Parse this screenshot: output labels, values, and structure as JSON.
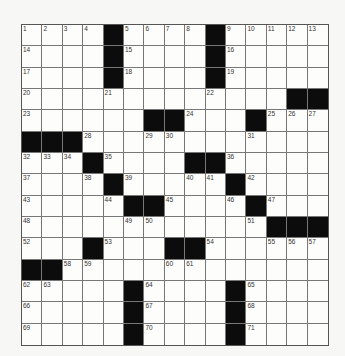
{
  "puzzle": {
    "rows": 15,
    "cols": 15,
    "grid": [
      [
        "1",
        "2",
        "3",
        "4",
        "#",
        "5",
        "6",
        "7",
        "8",
        "#",
        "9",
        "10",
        "11",
        "12",
        "13"
      ],
      [
        "14",
        "",
        "",
        "",
        "#",
        "15",
        "",
        "",
        "",
        "#",
        "16",
        "",
        "",
        "",
        ""
      ],
      [
        "17",
        "",
        "",
        "",
        "#",
        "18",
        "",
        "",
        "",
        "#",
        "19",
        "",
        "",
        "",
        ""
      ],
      [
        "20",
        "",
        "",
        "",
        "21",
        "",
        "",
        "",
        "",
        "22",
        "",
        "",
        "",
        "#",
        "#"
      ],
      [
        "23",
        "",
        "",
        "",
        "",
        "",
        "#",
        "#",
        "24",
        "",
        "",
        "#",
        "25",
        "26",
        "27"
      ],
      [
        "#",
        "#",
        "#",
        "28",
        "",
        "",
        "29",
        "30",
        "",
        "",
        "",
        "31",
        "",
        "",
        ""
      ],
      [
        "32",
        "33",
        "34",
        "#",
        "35",
        "",
        "",
        "",
        "#",
        "#",
        "36",
        "",
        "",
        "",
        ""
      ],
      [
        "37",
        "",
        "",
        "38",
        "#",
        "39",
        "",
        "",
        "40",
        "41",
        "#",
        "42",
        "",
        "",
        ""
      ],
      [
        "43",
        "",
        "",
        "",
        "44",
        "#",
        "#",
        "45",
        "",
        "",
        "46",
        "#",
        "47",
        "",
        ""
      ],
      [
        "48",
        "",
        "",
        "",
        "",
        "49",
        "50",
        "",
        "",
        "",
        "",
        "51",
        "#",
        "#",
        "#"
      ],
      [
        "52",
        "",
        "",
        "#",
        "53",
        "",
        "",
        "#",
        "#",
        "54",
        "",
        "",
        "55",
        "56",
        "57"
      ],
      [
        "#",
        "#",
        "58",
        "59",
        "",
        "",
        "",
        "60",
        "61",
        "",
        "",
        "",
        "",
        "",
        ""
      ],
      [
        "62",
        "63",
        "",
        "",
        "",
        "#",
        "64",
        "",
        "",
        "",
        "#",
        "65",
        "",
        "",
        ""
      ],
      [
        "66",
        "",
        "",
        "",
        "",
        "#",
        "67",
        "",
        "",
        "",
        "#",
        "68",
        "",
        "",
        ""
      ],
      [
        "69",
        "",
        "",
        "",
        "",
        "#",
        "70",
        "",
        "",
        "",
        "#",
        "71",
        "",
        "",
        ""
      ]
    ]
  }
}
